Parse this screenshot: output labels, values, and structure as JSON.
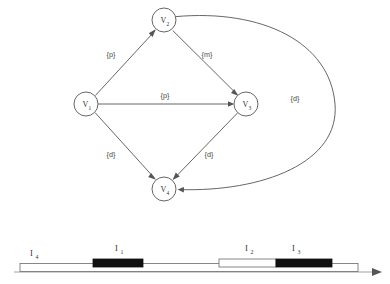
{
  "figure": {
    "stroke_color": "#555555",
    "fill_color": "#111111",
    "background": "#ffffff"
  },
  "graph": {
    "type": "directed-graph",
    "nodes": [
      {
        "id": "V1",
        "base": "V",
        "sub": "1",
        "cx": 86,
        "cy": 104,
        "r": 12
      },
      {
        "id": "V2",
        "base": "V",
        "sub": "2",
        "cx": 164,
        "cy": 20,
        "r": 12
      },
      {
        "id": "V3",
        "base": "V",
        "sub": "3",
        "cx": 246,
        "cy": 104,
        "r": 12
      },
      {
        "id": "V4",
        "base": "V",
        "sub": "4",
        "cx": 164,
        "cy": 189,
        "r": 12
      }
    ],
    "edges": [
      {
        "from": "V1",
        "to": "V2",
        "label": "{p}",
        "label_x": 111,
        "label_y": 57,
        "curved": false
      },
      {
        "from": "V2",
        "to": "V3",
        "label": "{m}",
        "label_x": 207,
        "label_y": 57,
        "curved": false
      },
      {
        "from": "V1",
        "to": "V3",
        "label": "{p}",
        "label_x": 165,
        "label_y": 98,
        "curved": false
      },
      {
        "from": "V1",
        "to": "V4",
        "label": "{d}",
        "label_x": 111,
        "label_y": 157,
        "curved": false
      },
      {
        "from": "V3",
        "to": "V4",
        "label": "{d}",
        "label_x": 209,
        "label_y": 157,
        "curved": false
      },
      {
        "from": "V2",
        "to": "V4",
        "label": "{d}",
        "label_x": 295,
        "label_y": 101,
        "curved": true
      }
    ]
  },
  "timeline": {
    "type": "interval-diagram",
    "axis": {
      "x_start": 14,
      "x_end": 382,
      "y": 272
    },
    "intervals": [
      {
        "id": "I4",
        "base": "I",
        "sub": "4",
        "x": 20,
        "width": 338,
        "filled": false,
        "label_x": 30,
        "label_y": 255
      },
      {
        "id": "I1",
        "base": "I",
        "sub": "1",
        "x": 93,
        "width": 50,
        "filled": true,
        "label_x": 115,
        "label_y": 248
      },
      {
        "id": "I2",
        "base": "I",
        "sub": "2",
        "x": 219,
        "width": 57,
        "filled": false,
        "label_x": 245,
        "label_y": 248
      },
      {
        "id": "I3",
        "base": "I",
        "sub": "3",
        "x": 276,
        "width": 56,
        "filled": true,
        "label_x": 292,
        "label_y": 248
      }
    ]
  }
}
